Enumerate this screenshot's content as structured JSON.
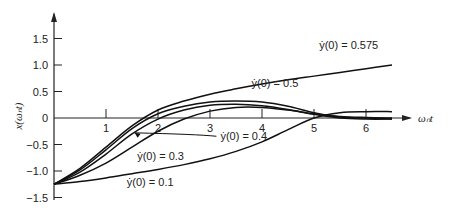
{
  "chart_data": {
    "type": "line",
    "title": "",
    "xlabel": "ω_n t",
    "ylabel": "x(ω_n t)",
    "xlim": [
      0,
      7
    ],
    "ylim": [
      -1.5,
      1.75
    ],
    "grid": false,
    "legend": "inline labels",
    "x_ticks": [
      "1",
      "2",
      "3",
      "4",
      "5",
      "6"
    ],
    "y_ticks": [
      "1.5",
      "1.0",
      "0.5",
      "0",
      "-0.5",
      "-1.0",
      "-1.5"
    ],
    "series": [
      {
        "name": "ẏ(0) = 0.575",
        "x": [
          0,
          0.5,
          1.0,
          1.5,
          2.0,
          2.5,
          3.0,
          3.5,
          4.0,
          4.5,
          5.0,
          5.5,
          6.0,
          6.5
        ],
        "values": [
          -1.25,
          -0.95,
          -0.55,
          -0.15,
          0.15,
          0.32,
          0.45,
          0.55,
          0.64,
          0.72,
          0.79,
          0.86,
          0.93,
          1.0
        ]
      },
      {
        "name": "ẏ(0) = 0.5",
        "x": [
          0,
          0.5,
          1.0,
          1.5,
          2.0,
          2.5,
          3.0,
          3.5,
          4.0,
          4.5,
          5.0,
          5.5,
          6.0,
          6.5
        ],
        "values": [
          -1.25,
          -0.98,
          -0.6,
          -0.2,
          0.08,
          0.22,
          0.3,
          0.32,
          0.3,
          0.22,
          0.1,
          0.02,
          0.0,
          -0.02
        ]
      },
      {
        "name": "ẏ(0) = 0.4",
        "x": [
          0,
          0.5,
          1.0,
          1.5,
          2.0,
          2.5,
          3.0,
          3.5,
          4.0,
          4.5,
          5.0,
          5.5,
          6.0,
          6.5
        ],
        "values": [
          -1.25,
          -1.02,
          -0.68,
          -0.3,
          -0.02,
          0.15,
          0.24,
          0.26,
          0.23,
          0.16,
          0.07,
          0.0,
          -0.02,
          -0.02
        ]
      },
      {
        "name": "ẏ(0) = 0.3",
        "x": [
          0,
          0.5,
          1.0,
          1.5,
          2.0,
          2.5,
          3.0,
          3.5,
          4.0,
          4.5,
          5.0,
          5.5,
          6.0,
          6.5
        ],
        "values": [
          -1.25,
          -1.08,
          -0.85,
          -0.55,
          -0.25,
          -0.02,
          0.13,
          0.2,
          0.2,
          0.15,
          0.08,
          0.03,
          0.01,
          0.0
        ]
      },
      {
        "name": "ẏ(0) = 0.1",
        "x": [
          0,
          0.5,
          1.0,
          1.5,
          2.0,
          2.5,
          3.0,
          3.5,
          4.0,
          4.5,
          5.0,
          5.5,
          6.0,
          6.5
        ],
        "values": [
          -1.25,
          -1.2,
          -1.13,
          -1.05,
          -0.97,
          -0.88,
          -0.77,
          -0.63,
          -0.45,
          -0.22,
          0.0,
          0.1,
          0.12,
          0.12
        ]
      }
    ],
    "annotations": [
      {
        "text": "ẏ(0) = 0.575",
        "x": 5.1,
        "y": 1.3
      },
      {
        "text": "ẏ(0) = 0.5",
        "x": 3.8,
        "y": 0.58
      },
      {
        "text": "ẏ(0) = 0.4",
        "x": 3.2,
        "y": -0.42,
        "arrow_to": [
          1.55,
          -0.28
        ]
      },
      {
        "text": "ẏ(0) = 0.3",
        "x": 1.6,
        "y": -0.8
      },
      {
        "text": "ẏ(0) = 0.1",
        "x": 1.4,
        "y": -1.28
      }
    ]
  },
  "labels": {
    "y_axis": "x(ωₙt)",
    "x_axis": "ωₙt"
  }
}
